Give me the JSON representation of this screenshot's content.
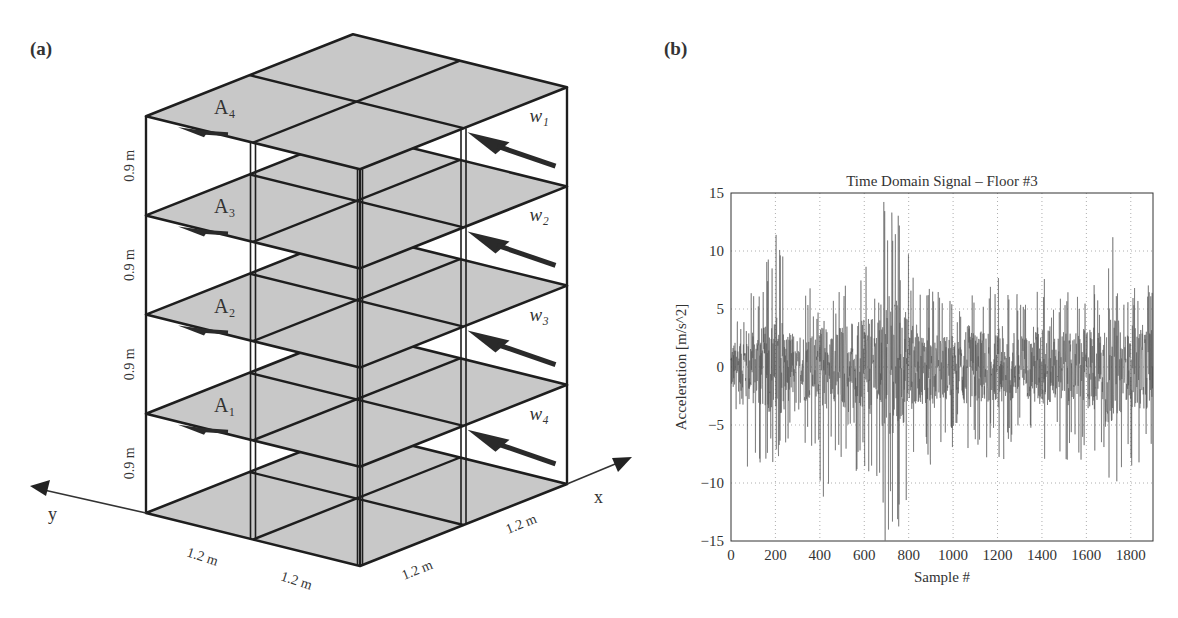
{
  "panels": {
    "a": {
      "label": "(a)"
    },
    "b": {
      "label": "(b)"
    }
  },
  "structure": {
    "floor_labels": [
      "A₄",
      "A₃",
      "A₂",
      "A₁"
    ],
    "force_labels": [
      "w₁",
      "w₂",
      "w₃",
      "w₄"
    ],
    "story_height_labels": [
      "0.9 m",
      "0.9 m",
      "0.9 m",
      "0.9 m"
    ],
    "bay_width_labels_y": [
      "1.2 m",
      "1.2 m"
    ],
    "bay_width_labels_x": [
      "1.2 m",
      "1.2 m"
    ],
    "axis_labels": {
      "x": "x",
      "y": "y"
    },
    "stories": 4,
    "bays_x": 2,
    "bays_y": 2,
    "colors": {
      "slab": "#c8c8c8",
      "frame": "#1e1e1e",
      "arrow": "#2a2a2a"
    }
  },
  "chart_data": {
    "type": "line",
    "title": "Time Domain Signal – Floor #3",
    "xlabel": "Sample #",
    "ylabel": "Acceleration [m/s^2]",
    "xlim": [
      0,
      1900
    ],
    "ylim": [
      -15,
      15
    ],
    "xticks": [
      0,
      200,
      400,
      600,
      800,
      1000,
      1200,
      1400,
      1600,
      1800
    ],
    "yticks": [
      -15,
      -10,
      -5,
      0,
      5,
      10,
      15
    ],
    "grid": true,
    "line_color": "#555555",
    "envelope_bin_size": 40,
    "envelope_max": [
      5,
      4.5,
      7.5,
      6.5,
      9.5,
      12,
      7,
      3,
      7,
      5.5,
      4,
      6,
      8.5,
      4,
      9.5,
      9.5,
      7.5,
      14.8,
      13.5,
      10.5,
      8,
      6.5,
      7,
      7.5,
      6,
      5,
      7.5,
      7,
      6.5,
      7,
      8,
      7.5,
      6.5,
      5.5,
      7.5,
      8,
      6,
      7,
      6.5,
      7,
      7.5,
      6,
      11.2,
      8.5,
      6,
      7.5,
      8.5,
      7.5
    ],
    "envelope_min": [
      -5,
      -10.5,
      -8,
      -9.5,
      -8.5,
      -9,
      -6.5,
      -4,
      -7,
      -7,
      -12.5,
      -7.5,
      -8,
      -5,
      -9,
      -9.5,
      -11.5,
      -15,
      -14,
      -12,
      -9,
      -8,
      -9,
      -6.5,
      -7,
      -5.5,
      -9,
      -7,
      -8,
      -6.5,
      -8,
      -7.5,
      -6,
      -7,
      -9,
      -8,
      -6,
      -8,
      -7.5,
      -8,
      -9.5,
      -8,
      -13,
      -10,
      -7,
      -9,
      -8,
      -7
    ]
  }
}
